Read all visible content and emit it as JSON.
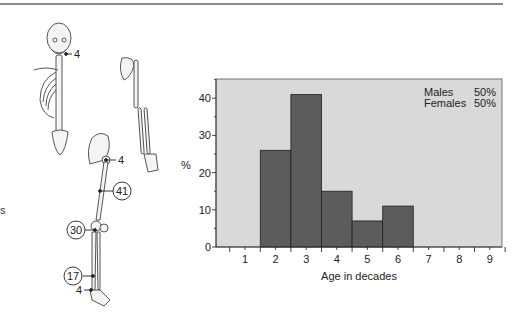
{
  "page": {
    "edge_text_fragment": "s"
  },
  "skeleton": {
    "annotations": [
      {
        "label": "4",
        "circled": false,
        "site": "skull/jaw"
      },
      {
        "label": "4",
        "circled": false,
        "site": "hip/pelvis"
      },
      {
        "label": "41",
        "circled": true,
        "site": "femur"
      },
      {
        "label": "30",
        "circled": true,
        "site": "knee"
      },
      {
        "label": "17",
        "circled": true,
        "site": "lower leg/tibia"
      },
      {
        "label": "4",
        "circled": false,
        "site": "ankle/foot"
      }
    ]
  },
  "chart_data": {
    "type": "bar",
    "title": "",
    "xlabel": "Age in decades",
    "ylabel": "%",
    "categories": [
      "1",
      "2",
      "3",
      "4",
      "5",
      "6",
      "7",
      "8",
      "9"
    ],
    "values": [
      0,
      26,
      41,
      15,
      7,
      11,
      0,
      0,
      0
    ],
    "ylim": [
      0,
      45
    ],
    "yticks": [
      0,
      10,
      20,
      30,
      40
    ],
    "grid": false,
    "bar_color": "#5c5c5c",
    "plot_background": "#d9d9d9",
    "legend": {
      "position": "top-right",
      "entries": [
        {
          "label": "Males",
          "value": "50%"
        },
        {
          "label": "Females",
          "value": "50%"
        }
      ]
    }
  }
}
